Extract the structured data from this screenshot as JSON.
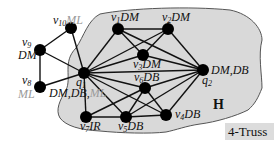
{
  "diagram": {
    "region_label": "H",
    "legend_label": "4-Truss",
    "colors": {
      "region_fill": "#d9d9d9",
      "region_stroke": "#555555",
      "node": "#000000",
      "edge": "#111111",
      "gray_label": "#9a9a9a",
      "legend_bg": "#dcdcdc"
    },
    "nodes": [
      {
        "id": "v10",
        "name": "v",
        "sub": "10",
        "attr": "ML",
        "attr_gray": true,
        "x": 71,
        "y": 28
      },
      {
        "id": "v9",
        "name": "v",
        "sub": "9",
        "attr": "DM",
        "attr_gray": false,
        "x": 40,
        "y": 50
      },
      {
        "id": "v8",
        "name": "v",
        "sub": "8",
        "attr": "ML",
        "attr_gray": true,
        "x": 40,
        "y": 87
      },
      {
        "id": "q1",
        "name": "q",
        "sub": "1",
        "attr": "DM,DB,ML",
        "attr_gray": false,
        "x": 84,
        "y": 73
      },
      {
        "id": "v1",
        "name": "v",
        "sub": "1",
        "attr": "DM",
        "attr_gray": false,
        "x": 118,
        "y": 29
      },
      {
        "id": "v2",
        "name": "v",
        "sub": "2",
        "attr": "DM",
        "attr_gray": false,
        "x": 168,
        "y": 29
      },
      {
        "id": "v3",
        "name": "v",
        "sub": "3",
        "attr": "DM",
        "attr_gray": false,
        "x": 143,
        "y": 55
      },
      {
        "id": "q2",
        "name": "q",
        "sub": "2",
        "attr": "DM,DB",
        "attr_gray": false,
        "x": 203,
        "y": 70
      },
      {
        "id": "v6",
        "name": "v",
        "sub": "6",
        "attr": "DB",
        "attr_gray": false,
        "x": 145,
        "y": 88
      },
      {
        "id": "v7",
        "name": "v",
        "sub": "7",
        "attr": "IR",
        "attr_gray": false,
        "x": 86,
        "y": 117
      },
      {
        "id": "v5",
        "name": "v",
        "sub": "5",
        "attr": "DB",
        "attr_gray": false,
        "x": 126,
        "y": 117
      },
      {
        "id": "v4",
        "name": "v",
        "sub": "4",
        "attr": "DB",
        "attr_gray": false,
        "x": 166,
        "y": 115
      }
    ],
    "edges": [
      [
        "v10",
        "v9"
      ],
      [
        "v10",
        "q1"
      ],
      [
        "v9",
        "q1"
      ],
      [
        "v9",
        "v8"
      ],
      [
        "v8",
        "q1"
      ],
      [
        "q1",
        "v1"
      ],
      [
        "q1",
        "v2"
      ],
      [
        "q1",
        "v3"
      ],
      [
        "q1",
        "q2"
      ],
      [
        "q1",
        "v6"
      ],
      [
        "q1",
        "v5"
      ],
      [
        "q1",
        "v4"
      ],
      [
        "q1",
        "v7"
      ],
      [
        "v1",
        "v2"
      ],
      [
        "v1",
        "v3"
      ],
      [
        "v1",
        "q2"
      ],
      [
        "v2",
        "v3"
      ],
      [
        "v2",
        "q2"
      ],
      [
        "v3",
        "q2"
      ],
      [
        "v6",
        "q2"
      ],
      [
        "v6",
        "v7"
      ],
      [
        "v6",
        "v5"
      ],
      [
        "v6",
        "v4"
      ],
      [
        "q2",
        "v5"
      ],
      [
        "q2",
        "v4"
      ],
      [
        "v7",
        "v5"
      ],
      [
        "v5",
        "v4"
      ]
    ]
  }
}
